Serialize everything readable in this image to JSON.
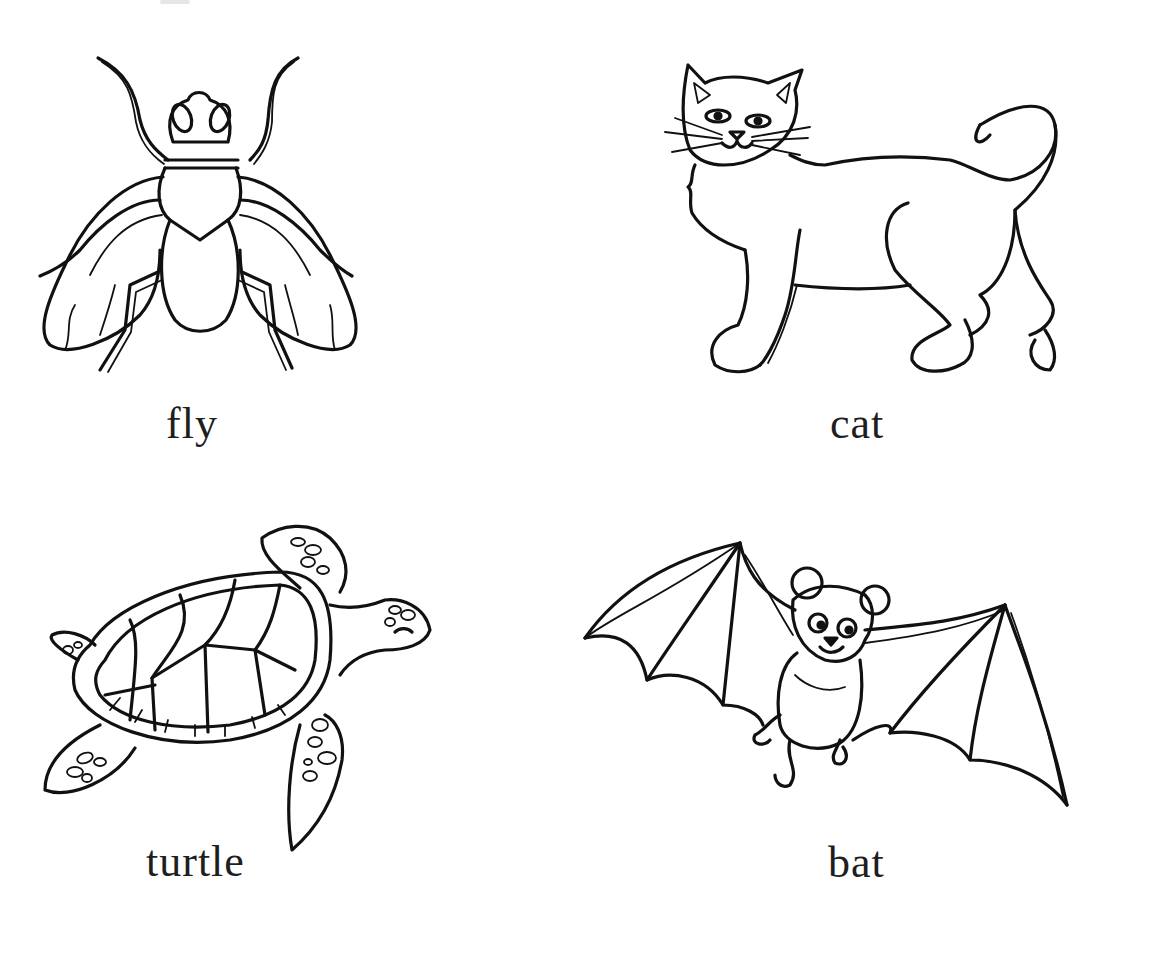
{
  "worksheet": {
    "cards": [
      {
        "id": "fly",
        "label": "fly"
      },
      {
        "id": "cat",
        "label": "cat"
      },
      {
        "id": "turtle",
        "label": "turtle"
      },
      {
        "id": "bat",
        "label": "bat"
      }
    ],
    "colors": {
      "ink": "#111111",
      "background": "#ffffff"
    }
  }
}
